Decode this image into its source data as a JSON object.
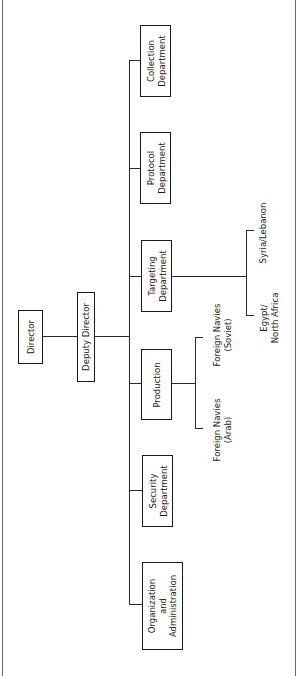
{
  "diagram": {
    "type": "organization-chart",
    "orientation": "rotated-90-ccw",
    "nodes": {
      "director": {
        "label": "Director"
      },
      "deputy_director": {
        "label": "Deputy Director"
      },
      "collection": {
        "line1": "Collection",
        "line2": "Department"
      },
      "protocol": {
        "line1": "Protocol",
        "line2": "Department"
      },
      "targeting": {
        "line1": "Targeting",
        "line2": "Department"
      },
      "production": {
        "label": "Production"
      },
      "security": {
        "line1": "Security",
        "line2": "Department"
      },
      "org_admin": {
        "line1": "Organization",
        "line2": "and",
        "line3": "Administration"
      }
    },
    "sub_units": {
      "targeting": [
        {
          "line1": "Syria/Lebanon"
        },
        {
          "line1": "Egypt/",
          "line2": "North Africa"
        }
      ],
      "production": [
        {
          "line1": "Foreign Navies",
          "line2": "(Soviet)"
        },
        {
          "line1": "Foreign Navies",
          "line2": "(Arab)"
        }
      ]
    },
    "edges": [
      [
        "Director",
        "Deputy Director"
      ],
      [
        "Deputy Director",
        "Collection Department"
      ],
      [
        "Deputy Director",
        "Protocol Department"
      ],
      [
        "Deputy Director",
        "Targeting Department"
      ],
      [
        "Deputy Director",
        "Production"
      ],
      [
        "Deputy Director",
        "Security Department"
      ],
      [
        "Deputy Director",
        "Organization and Administration"
      ],
      [
        "Targeting Department",
        "Syria/Lebanon"
      ],
      [
        "Targeting Department",
        "Egypt/North Africa"
      ],
      [
        "Production",
        "Foreign Navies (Soviet)"
      ],
      [
        "Production",
        "Foreign Navies (Arab)"
      ]
    ]
  }
}
